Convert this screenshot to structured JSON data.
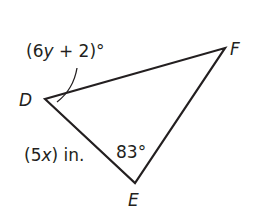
{
  "diagram": {
    "type": "triangle",
    "vertices": {
      "D": {
        "label": "D",
        "x": 45,
        "y": 99
      },
      "E": {
        "label": "E",
        "x": 135,
        "y": 183
      },
      "F": {
        "label": "F",
        "x": 225,
        "y": 48
      }
    },
    "angle_D": {
      "expr_open": "(6",
      "var": "y",
      "expr_close": " + 2)°"
    },
    "angle_E": {
      "label": "83°"
    },
    "side_DE": {
      "open": "(5",
      "var": "x",
      "close": ") in."
    },
    "stroke_color": "#231f20"
  }
}
